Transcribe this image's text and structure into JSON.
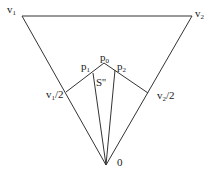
{
  "diagram": {
    "title": "",
    "stroke_color": "#333333",
    "background": "#ffffff",
    "points": {
      "v1": {
        "x": 22,
        "y": 16
      },
      "v2": {
        "x": 192,
        "y": 16
      },
      "origin": {
        "x": 106,
        "y": 165
      },
      "p0": {
        "x": 104,
        "y": 63
      },
      "p1": {
        "x": 93,
        "y": 73
      },
      "p2": {
        "x": 115,
        "y": 71
      },
      "v1_half": {
        "x": 66,
        "y": 92
      },
      "v2_half": {
        "x": 148,
        "y": 93
      }
    },
    "labels": {
      "v1": {
        "base": "v",
        "sub": "1",
        "suffix": ""
      },
      "v2": {
        "base": "v",
        "sub": "2",
        "suffix": ""
      },
      "p0": {
        "base": "p",
        "sub": "0",
        "suffix": ""
      },
      "p1": {
        "base": "p",
        "sub": "1",
        "suffix": ""
      },
      "p2": {
        "base": "p",
        "sub": "2",
        "suffix": ""
      },
      "s": {
        "text": "S''"
      },
      "v1_half": {
        "base": "v",
        "sub": "1",
        "suffix": "/2"
      },
      "v2_half": {
        "base": "v",
        "sub": "2",
        "suffix": "/2"
      },
      "origin": {
        "text": "0"
      }
    }
  }
}
